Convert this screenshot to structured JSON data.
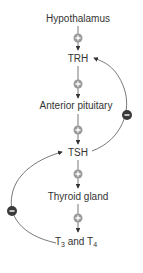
{
  "diagram": {
    "nodes": [
      {
        "id": "hypothalamus",
        "label": "Hypothalamus"
      },
      {
        "id": "trh",
        "label": "TRH"
      },
      {
        "id": "anterior_pituitary",
        "label": "Anterior pituitary"
      },
      {
        "id": "tsh",
        "label": "TSH"
      },
      {
        "id": "thyroid_gland",
        "label": "Thyroid gland"
      },
      {
        "id": "t3_t4",
        "label_parts": [
          "T",
          "3",
          " and T",
          "4"
        ]
      }
    ],
    "edges": [
      {
        "from": "hypothalamus",
        "to": "trh",
        "sign": "+"
      },
      {
        "from": "trh",
        "to": "anterior_pituitary",
        "sign": "+"
      },
      {
        "from": "anterior_pituitary",
        "to": "tsh",
        "sign": "+"
      },
      {
        "from": "tsh",
        "to": "thyroid_gland",
        "sign": "+"
      },
      {
        "from": "thyroid_gland",
        "to": "t3_t4",
        "sign": "+"
      },
      {
        "from": "tsh",
        "to": "trh",
        "sign": "-",
        "side": "right"
      },
      {
        "from": "t3_t4",
        "to": "tsh",
        "sign": "-",
        "side": "left"
      }
    ],
    "colors": {
      "line": "#555555",
      "plus_fill": "#9a9a9a",
      "minus_fill": "#3a3a3a",
      "text": "#333333"
    }
  }
}
